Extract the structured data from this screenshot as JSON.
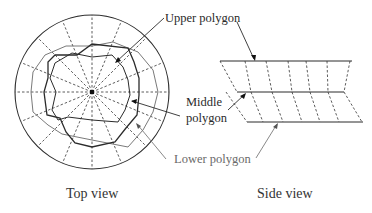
{
  "figure": {
    "top_view": {
      "caption": "Top view",
      "center": [
        92,
        92
      ],
      "outer_radius": 77,
      "radial_lines": 16
    },
    "side_view": {
      "caption": "Side view"
    },
    "labels": {
      "upper": "Upper polygon",
      "middle_line1": "Middle",
      "middle_line2": "polygon",
      "lower": "Lower polygon"
    },
    "colors": {
      "line": "#2b2b2b",
      "lower_polygon": "#7a7a7a",
      "dashed": "#333333"
    }
  }
}
